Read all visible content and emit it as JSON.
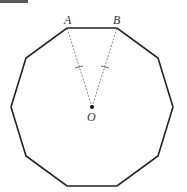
{
  "figure": {
    "shape": "regular decagon",
    "sides": 10,
    "labels": {
      "vertex_a": "A",
      "vertex_b": "B",
      "center": "O"
    },
    "segments": [
      {
        "from": "O",
        "to": "A",
        "style": "dashed",
        "tick_marks": 1
      },
      {
        "from": "O",
        "to": "B",
        "style": "dashed",
        "tick_marks": 1
      }
    ],
    "colors": {
      "outline": "#222222",
      "dashed": "#777777",
      "label": "#333333"
    }
  }
}
